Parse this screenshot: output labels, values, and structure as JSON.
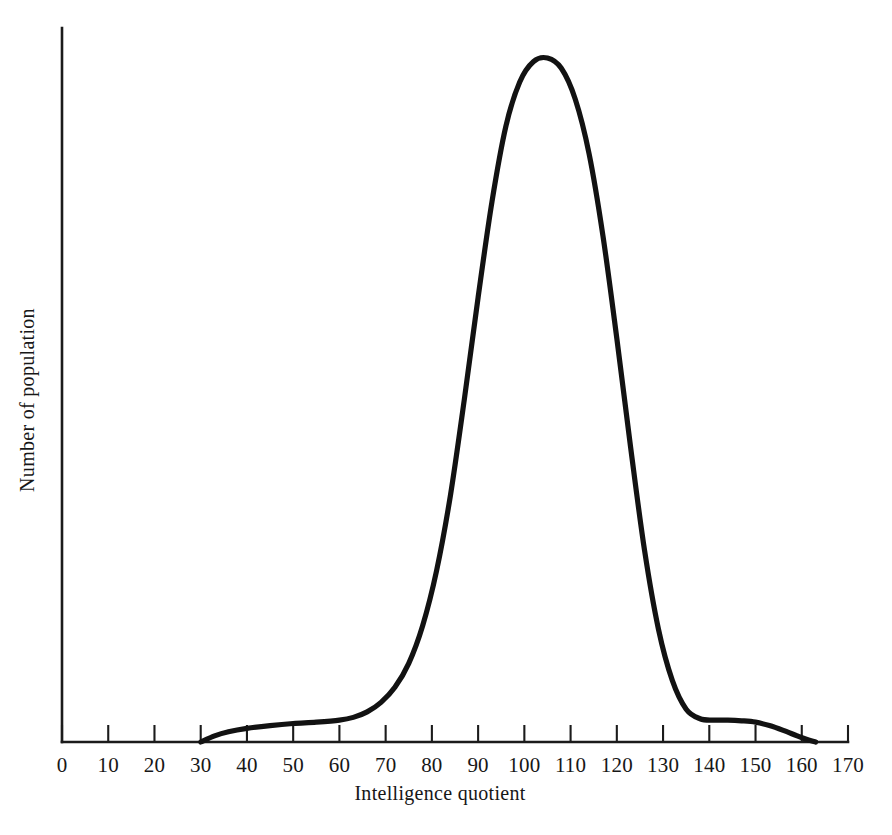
{
  "chart_data": {
    "type": "line",
    "title": "",
    "xlabel": "Intelligence quotient",
    "ylabel": "Number of population",
    "xlim": [
      0,
      170
    ],
    "ylim": [
      0,
      100
    ],
    "grid": false,
    "legend": "none",
    "xticks": [
      0,
      10,
      20,
      30,
      40,
      50,
      60,
      70,
      80,
      90,
      100,
      110,
      120,
      130,
      140,
      150,
      160,
      170
    ],
    "xtick_labels": [
      "0",
      "10",
      "20",
      "30",
      "40",
      "50",
      "60",
      "70",
      "80",
      "90",
      "100",
      "110",
      "120",
      "130",
      "140",
      "150",
      "160",
      "170"
    ],
    "yticks": [],
    "ytick_labels": [],
    "series": [
      {
        "name": "Number of population",
        "color": "#121212",
        "x": [
          30,
          33,
          36,
          40,
          45,
          50,
          55,
          60,
          63,
          66,
          69,
          72,
          75,
          78,
          81,
          84,
          87,
          90,
          93,
          96,
          99,
          102,
          105,
          108,
          111,
          114,
          117,
          120,
          123,
          126,
          129,
          132,
          135,
          138,
          141,
          144,
          147,
          150,
          153,
          156,
          159,
          161,
          163
        ],
        "y": [
          0,
          0.9,
          1.5,
          2.0,
          2.4,
          2.7,
          2.9,
          3.2,
          3.6,
          4.4,
          5.8,
          8.0,
          11.5,
          17.0,
          25.0,
          36.0,
          50.0,
          65.0,
          79.0,
          90.0,
          96.5,
          99.5,
          100.0,
          98.5,
          94.0,
          86.0,
          74.0,
          59.0,
          43.0,
          28.0,
          16.5,
          9.0,
          4.8,
          3.4,
          3.2,
          3.2,
          3.1,
          2.9,
          2.4,
          1.7,
          0.9,
          0.4,
          0
        ]
      }
    ],
    "annotations": {
      "curve_start_x": 30,
      "curve_end_x": 163,
      "peak_x": 105,
      "peak_label": "",
      "left_shoulder_range": [
        40,
        65
      ],
      "right_shoulder_range": [
        135,
        150
      ]
    }
  },
  "axes": {
    "x_axis_name": "x-axis",
    "y_axis_name": "y-axis",
    "x_title": "Intelligence quotient",
    "y_title": "Number of population"
  },
  "colors": {
    "curve": "#121212",
    "axis": "#1b1b1b",
    "background": "#ffffff",
    "text": "#171717"
  }
}
